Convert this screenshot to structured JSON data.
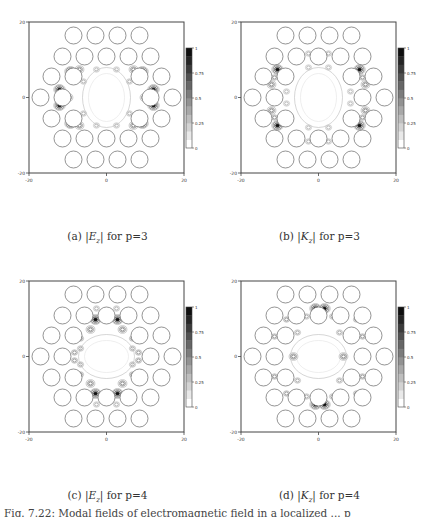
{
  "figure": {
    "caption_partial": "Fig. 7.22: Modal fields of electromagnetic field in a localized ... p",
    "panels": [
      {
        "id": "a",
        "label": "(a)",
        "quantity": "|E",
        "sub": "z",
        "suffix": "| for p=3"
      },
      {
        "id": "b",
        "label": "(b)",
        "quantity": "|K",
        "sub": "z",
        "suffix": "| for p=3"
      },
      {
        "id": "c",
        "label": "(c)",
        "quantity": "|E",
        "sub": "z",
        "suffix": "| for p=4"
      },
      {
        "id": "d",
        "label": "(d)",
        "quantity": "|K",
        "sub": "z",
        "suffix": "| for p=4"
      }
    ]
  },
  "axes": {
    "x_ticks": [
      "-20",
      "0",
      "20"
    ],
    "y_ticks": [
      "-20",
      "0",
      "20"
    ],
    "xlim": [
      -20,
      20
    ],
    "ylim": [
      -20,
      20
    ]
  },
  "colorbar": {
    "ticks": [
      "0",
      "0.25",
      "0.5",
      "0.75",
      "1"
    ],
    "range": [
      0,
      1
    ],
    "colormap": "grayscale (white=0, black=1)"
  },
  "chart_data": [
    {
      "type": "heatmap",
      "title": "(a) |Ez| for p=3",
      "xlim": [
        -20,
        20
      ],
      "ylim": [
        -20,
        20
      ],
      "colorbar": [
        0,
        0.25,
        0.5,
        0.75,
        1
      ],
      "structure": "hexagonal array of dielectric rods with central defect cavity",
      "peaks": "field maxima concentrated left and right of cavity"
    },
    {
      "type": "heatmap",
      "title": "(b) |Kz| for p=3",
      "xlim": [
        -20,
        20
      ],
      "ylim": [
        -20,
        20
      ],
      "colorbar": [
        0,
        0.25,
        0.5,
        0.75,
        1
      ],
      "structure": "hexagonal array of dielectric rods with central defect cavity",
      "peaks": "field maxima at diagonal corners of cavity"
    },
    {
      "type": "heatmap",
      "title": "(c) |Ez| for p=4",
      "xlim": [
        -20,
        20
      ],
      "ylim": [
        -20,
        20
      ],
      "colorbar": [
        0,
        0.25,
        0.5,
        0.75,
        1
      ],
      "structure": "hexagonal array of dielectric rods with central defect cavity",
      "peaks": "field maxima above and below cavity"
    },
    {
      "type": "heatmap",
      "title": "(d) |Kz| for p=4",
      "xlim": [
        -20,
        20
      ],
      "ylim": [
        -20,
        20
      ],
      "colorbar": [
        0,
        0.25,
        0.5,
        0.75,
        1
      ],
      "structure": "hexagonal array of dielectric rods with central defect cavity",
      "peaks": "field maxima at top and bottom of cavity"
    }
  ]
}
